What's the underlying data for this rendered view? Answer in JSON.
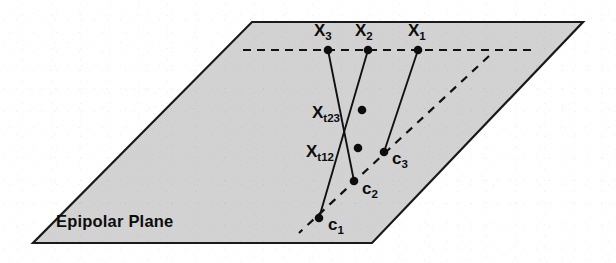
{
  "figure": {
    "title": "Epipolar Plane",
    "plane_label": "Epipolar Plane",
    "colors": {
      "plane_fill": "#d2d2d2",
      "outline": "#1a1a1a",
      "line": "#111111",
      "dot": "#0d0d0d",
      "background": "#ffffff"
    }
  },
  "plane": {
    "name": "epipolar-plane",
    "corners": [
      {
        "x": 252,
        "y": 22
      },
      {
        "x": 583,
        "y": 22
      },
      {
        "x": 372,
        "y": 243
      },
      {
        "x": 33,
        "y": 243
      }
    ]
  },
  "dashed_lines": [
    {
      "name": "image-line-horizontal",
      "x1": 243,
      "y1": 50,
      "x2": 537,
      "y2": 50
    },
    {
      "name": "baseline-diagonal",
      "x1": 489,
      "y1": 56,
      "x2": 299,
      "y2": 233
    }
  ],
  "points": [
    {
      "id": "X3",
      "label_base": "X",
      "label_sub": "3",
      "x": 328,
      "y": 50,
      "label_x": 314,
      "label_y": 22
    },
    {
      "id": "X2",
      "label_base": "X",
      "label_sub": "2",
      "x": 368,
      "y": 50,
      "label_x": 355,
      "label_y": 22
    },
    {
      "id": "X1",
      "label_base": "X",
      "label_sub": "1",
      "x": 418,
      "y": 50,
      "label_x": 408,
      "label_y": 22
    },
    {
      "id": "Xt23",
      "label_base": "X",
      "label_sub": "t23",
      "x": 362,
      "y": 110,
      "label_x": 312,
      "label_y": 104
    },
    {
      "id": "Xt12",
      "label_base": "X",
      "label_sub": "t12",
      "x": 358,
      "y": 148,
      "label_x": 306,
      "label_y": 143
    },
    {
      "id": "c3",
      "label_base": "c",
      "label_sub": "3",
      "x": 384,
      "y": 152,
      "label_x": 392,
      "label_y": 150
    },
    {
      "id": "c2",
      "label_base": "c",
      "label_sub": "2",
      "x": 354,
      "y": 181,
      "label_x": 362,
      "label_y": 180
    },
    {
      "id": "c1",
      "label_base": "c",
      "label_sub": "1",
      "x": 319,
      "y": 218,
      "label_x": 328,
      "label_y": 216
    }
  ],
  "rays": [
    {
      "name": "ray-x3-to-c2",
      "x1": 328,
      "y1": 50,
      "x2": 354,
      "y2": 181
    },
    {
      "name": "ray-x2-to-c1",
      "x1": 368,
      "y1": 50,
      "x2": 319,
      "y2": 218
    },
    {
      "name": "ray-x1-to-c3",
      "x1": 418,
      "y1": 50,
      "x2": 384,
      "y2": 152
    }
  ],
  "plane_label_position": {
    "x": 56,
    "y": 213
  }
}
